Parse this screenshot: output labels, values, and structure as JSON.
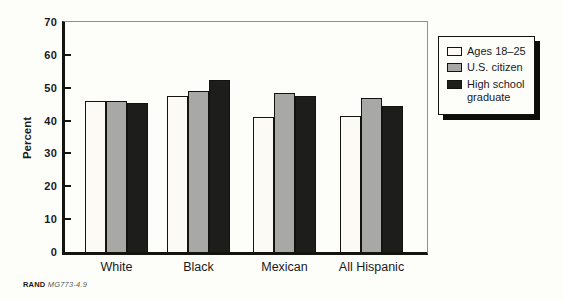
{
  "chart_data": {
    "type": "bar",
    "ylabel": "Percent",
    "ylim": [
      0,
      70
    ],
    "yticks": [
      0,
      10,
      20,
      30,
      40,
      50,
      60,
      70
    ],
    "grid": false,
    "legend_position": "outside-upper-right",
    "categories": [
      "White",
      "Black",
      "Mexican",
      "All Hispanic"
    ],
    "series": [
      {
        "name": "Ages 18–25",
        "color": "#fbfaf4",
        "values": [
          46,
          47.5,
          41,
          41.5
        ]
      },
      {
        "name": "U.S. citizen",
        "color": "#a8a8a6",
        "values": [
          46,
          49,
          48.5,
          47
        ]
      },
      {
        "name": "High school graduate",
        "color": "#1d1d1b",
        "values": [
          45.5,
          52.5,
          47.5,
          44.5
        ]
      }
    ]
  },
  "footer": {
    "brand": "RAND",
    "doc_id": "MG773-4.9"
  }
}
